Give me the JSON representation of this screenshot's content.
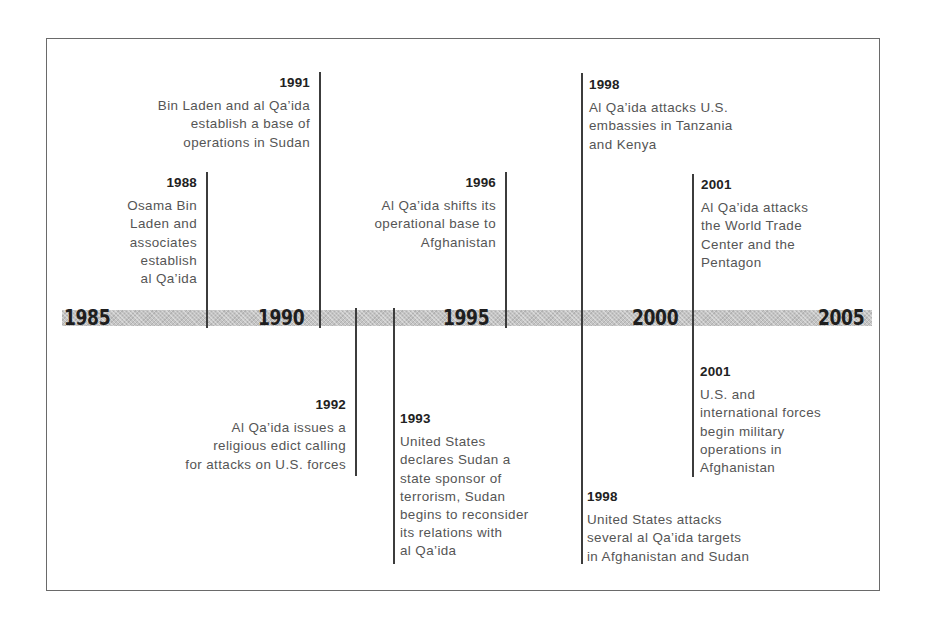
{
  "axis": {
    "years": [
      "1985",
      "1990",
      "1995",
      "2000",
      "2005"
    ]
  },
  "events": [
    {
      "year": "1988",
      "text": "Osama Bin\nLaden and\nassociates\nestablish\nal Qa’ida",
      "side": "above"
    },
    {
      "year": "1991",
      "text": "Bin Laden and al Qa’ida\nestablish a base of\noperations in Sudan",
      "side": "above"
    },
    {
      "year": "1992",
      "text": "Al Qa’ida issues a\nreligious edict calling\nfor attacks on U.S. forces",
      "side": "below"
    },
    {
      "year": "1993",
      "text": "United States\ndeclares Sudan a\nstate sponsor of\nterrorism, Sudan\nbegins to reconsider\nits relations with\nal Qa’ida",
      "side": "below"
    },
    {
      "year": "1996",
      "text": "Al Qa’ida shifts its\noperational base to\nAfghanistan",
      "side": "above"
    },
    {
      "year": "1998",
      "text": "Al Qa’ida attacks U.S.\nembassies in Tanzania\nand Kenya",
      "side": "above"
    },
    {
      "year": "1998",
      "text": "United States attacks\nseveral al Qa’ida targets\nin Afghanistan and Sudan",
      "side": "below"
    },
    {
      "year": "2001",
      "text": "Al Qa’ida attacks\nthe World Trade\nCenter and the\nPentagon",
      "side": "above"
    },
    {
      "year": "2001",
      "text": "U.S. and\ninternational forces\nbegin military\noperations in\nAfghanistan",
      "side": "below"
    }
  ],
  "colors": {
    "band": "#c4c4c4",
    "line": "#3c3c3c",
    "year_text": "#1e1e1e",
    "body_text": "#555555"
  }
}
